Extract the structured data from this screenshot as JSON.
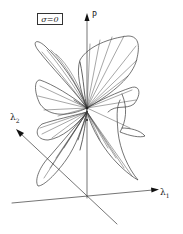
{
  "figure": {
    "parameter_label": "σ=0",
    "axes": {
      "vertical": {
        "label": "P"
      },
      "horizontal": {
        "label": "λ",
        "subscript": "1"
      },
      "depth": {
        "label": "λ",
        "subscript": "2"
      }
    },
    "colors": {
      "stroke": "#333333",
      "background": "#ffffff"
    }
  }
}
